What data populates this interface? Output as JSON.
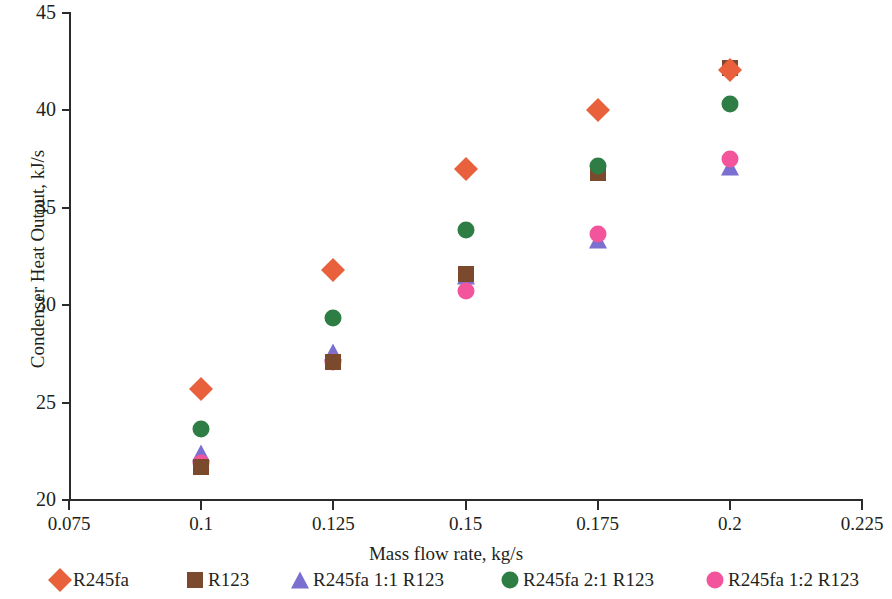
{
  "chart_data": {
    "type": "scatter",
    "title": "",
    "xlabel": "Mass flow rate, kg/s",
    "ylabel": "Condenser Heat Output, kJ/s",
    "xlim": [
      0.075,
      0.225
    ],
    "ylim": [
      20,
      45
    ],
    "xticks": [
      "0.075",
      "0.1",
      "0.125",
      "0.15",
      "0.175",
      "0.2",
      "0.225"
    ],
    "xtick_values": [
      0.075,
      0.1,
      0.125,
      0.15,
      0.175,
      0.2,
      0.225
    ],
    "yticks": [
      "20",
      "25",
      "30",
      "35",
      "40",
      "45"
    ],
    "ytick_values": [
      20,
      25,
      30,
      35,
      40,
      45
    ],
    "grid": false,
    "legend_position": "bottom",
    "x": [
      0.1,
      0.125,
      0.15,
      0.175,
      0.2
    ],
    "series": [
      {
        "name": "R245fa",
        "marker": "diamond",
        "color": "#e8613c",
        "values": [
          25.7,
          31.8,
          37.0,
          40.0,
          42.05
        ]
      },
      {
        "name": "R123",
        "marker": "square",
        "color": "#7b4a2d",
        "values": [
          21.7,
          27.1,
          31.6,
          36.8,
          42.2
        ]
      },
      {
        "name": "R245fa 1:1 R123",
        "marker": "triangle",
        "color": "#7b6fd0",
        "values": [
          22.4,
          27.6,
          31.5,
          33.35,
          37.1
        ]
      },
      {
        "name": "R245fa 2:1 R123",
        "marker": "circle",
        "color": "#2e7d45",
        "values": [
          23.65,
          29.35,
          33.85,
          37.15,
          40.35
        ]
      },
      {
        "name": "R245fa 1:2 R123",
        "marker": "circle",
        "color": "#f2559b",
        "values": [
          21.9,
          27.1,
          30.75,
          33.65,
          37.5
        ]
      }
    ]
  },
  "legend": {
    "items": [
      {
        "label": "R245fa",
        "marker": "diamond",
        "color": "#e8613c",
        "left": 50
      },
      {
        "label": "R123",
        "marker": "square",
        "color": "#7b4a2d",
        "left": 185
      },
      {
        "label": "R245fa 1:1 R123",
        "marker": "triangle",
        "color": "#7b6fd0",
        "left": 290
      },
      {
        "label": "R245fa 2:1 R123",
        "marker": "circle",
        "color": "#2e7d45",
        "left": 500
      },
      {
        "label": "R245fa 1:2 R123",
        "marker": "circle",
        "color": "#f2559b",
        "left": 705
      }
    ]
  }
}
